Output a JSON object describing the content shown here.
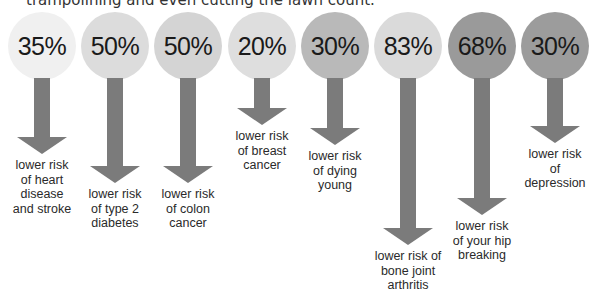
{
  "intro_text": "trampolining and even cutting the lawn count.",
  "stats": [
    {
      "percent": "35%",
      "label_lines": [
        "lower risk",
        "of heart",
        "disease",
        "and stroke"
      ],
      "circle_color": "#f0f0f0"
    },
    {
      "percent": "50%",
      "label_lines": [
        "lower risk",
        "of type 2",
        "diabetes"
      ],
      "circle_color": "#dcdcdc"
    },
    {
      "percent": "50%",
      "label_lines": [
        "lower risk",
        "of colon",
        "cancer"
      ],
      "circle_color": "#d4d4d4"
    },
    {
      "percent": "20%",
      "label_lines": [
        "lower risk",
        "of breast",
        "cancer"
      ],
      "circle_color": "#dedede"
    },
    {
      "percent": "30%",
      "label_lines": [
        "lower risk",
        "of dying",
        "young"
      ],
      "circle_color": "#b9b9b9"
    },
    {
      "percent": "83%",
      "label_lines": [
        "lower risk of",
        "bone joint",
        "arthritis"
      ],
      "circle_color": "#dadada"
    },
    {
      "percent": "68%",
      "label_lines": [
        "lower risk",
        "of your hip",
        "breaking"
      ],
      "circle_color": "#9a9a9a"
    },
    {
      "percent": "30%",
      "label_lines": [
        "lower risk",
        "of",
        "depression"
      ],
      "circle_color": "#9c9c9c"
    }
  ],
  "colors": {
    "arrow": "#7b7b7b",
    "text": "#2a2a2a"
  }
}
